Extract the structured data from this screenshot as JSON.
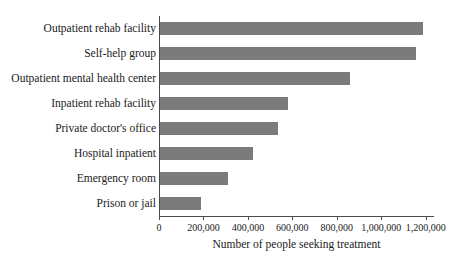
{
  "chart_data": {
    "type": "bar",
    "orientation": "horizontal",
    "title": "",
    "xlabel": "Number of people seeking treatment",
    "ylabel": "",
    "categories": [
      "Outpatient rehab facility",
      "Self-help group",
      "Outpatient mental health center",
      "Inpatient rehab facility",
      "Private doctor's office",
      "Hospital inpatient",
      "Emergency room",
      "Prison or jail"
    ],
    "values": [
      1185000,
      1150000,
      855000,
      575000,
      530000,
      420000,
      305000,
      185000
    ],
    "xlim": [
      0,
      1233000
    ],
    "xticks": [
      0,
      200000,
      400000,
      600000,
      800000,
      1000000,
      1200000
    ],
    "xtick_labels": [
      "0",
      "200,000",
      "400,000",
      "600,000",
      "800,000",
      "1,000,000",
      "1,200,000"
    ],
    "grid": false,
    "legend": false,
    "bar_color": "#7b7b7b",
    "axis_color": "#4a4a4a",
    "background_color": "#ffffff"
  }
}
